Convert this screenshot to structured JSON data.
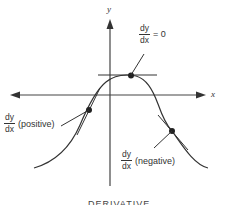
{
  "diagram": {
    "axes": {
      "x_label": "x",
      "y_label": "y"
    },
    "annotations": {
      "zero": {
        "num": "dy",
        "den": "dx",
        "suffix": "= 0"
      },
      "positive": {
        "num": "dy",
        "den": "dx",
        "suffix": "(positive)"
      },
      "negative": {
        "num": "dy",
        "den": "dx",
        "suffix": "(negative)"
      }
    },
    "caption": "DERIVATIVE",
    "colors": {
      "line": "#333333",
      "background": "#ffffff"
    }
  }
}
